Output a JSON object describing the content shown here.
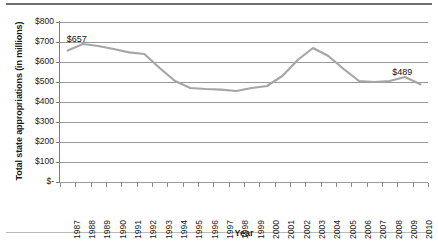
{
  "chart_data": {
    "type": "line",
    "title": "",
    "xlabel": "Year",
    "ylabel": "Total state appropriations (in millions)",
    "x": [
      1987,
      1988,
      1989,
      1990,
      1991,
      1992,
      1993,
      1994,
      1995,
      1996,
      1997,
      1998,
      1999,
      2000,
      2001,
      2002,
      2003,
      2004,
      2005,
      2006,
      2007,
      2008,
      2009,
      2010
    ],
    "categories": [
      "1987",
      "1988",
      "1989",
      "1990",
      "1991",
      "1992",
      "1993",
      "1994",
      "1995",
      "1996",
      "1997",
      "1998",
      "1999",
      "2000",
      "2001",
      "2002",
      "2003",
      "2004",
      "2005",
      "2006",
      "2007",
      "2008",
      "2009",
      "2010"
    ],
    "values": [
      657,
      690,
      680,
      665,
      648,
      640,
      570,
      505,
      470,
      465,
      462,
      455,
      470,
      480,
      530,
      610,
      670,
      630,
      565,
      505,
      500,
      505,
      525,
      489
    ],
    "ylim": [
      0,
      800
    ],
    "ytick_values": [
      0,
      100,
      200,
      300,
      400,
      500,
      600,
      700,
      800
    ],
    "ytick_labels": [
      "$-",
      "$100",
      "$200",
      "$300",
      "$400",
      "$500",
      "$600",
      "$700",
      "$800"
    ],
    "grid": true,
    "legend": false,
    "series_color": "#a6a6a6",
    "annotations": [
      {
        "text": "$657",
        "year": 1987,
        "value": 657
      },
      {
        "text": "$489",
        "year": 2010,
        "value": 489
      }
    ]
  }
}
